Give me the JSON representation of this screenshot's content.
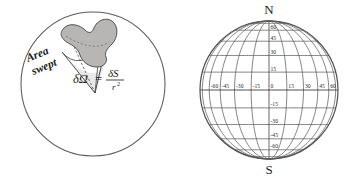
{
  "figure": {
    "width": 357,
    "height": 178,
    "background": "#ffffff",
    "ink_color": "#3a3a3a",
    "text_color": "#1b1b1b"
  },
  "left_panel": {
    "name": "solid-angle-diagram",
    "sphere": {
      "label": "sphere-outline",
      "cx": 93,
      "cy": 84,
      "r": 72,
      "stroke": "#5a5a5a"
    },
    "patch": {
      "label": "Area swept",
      "fill": "#b8b6b4",
      "stroke": "#4a4a4a"
    },
    "annotation": {
      "area_label_line1": "Area",
      "area_label_line2": "swept",
      "rotation_deg": -22
    },
    "formula": {
      "symbol": "δΩ",
      "equals": "=",
      "numerator": "δS",
      "denominator": "r",
      "denominator_exponent": "2",
      "full_text": "δΩ = δS / r²"
    },
    "apex": {
      "x": 95,
      "y": 93
    }
  },
  "right_panel": {
    "name": "globe-graticule-diagram",
    "globe": {
      "cx": 89,
      "cy": 90,
      "rx": 69,
      "ry": 69,
      "stroke": "#4f4f4f"
    },
    "poles": {
      "north_label": "N",
      "south_label": "S"
    },
    "graticule": {
      "spacing_degrees": 15,
      "meridian_longitudes": [
        -75,
        -60,
        -45,
        -30,
        -15,
        0,
        15,
        30,
        45,
        60,
        75
      ],
      "parallel_latitudes": [
        75,
        60,
        45,
        30,
        15,
        0,
        -15,
        -30,
        -45,
        -60,
        -75
      ],
      "grid_color": "#5a5a5a",
      "equator_color": "#4a4a4a"
    },
    "longitude_labels": [
      "-60",
      "-45",
      "-30",
      "-15",
      "0",
      "15",
      "30",
      "45",
      "60"
    ],
    "longitude_label_values": [
      -60,
      -45,
      -30,
      -15,
      0,
      15,
      30,
      45,
      60
    ],
    "latitude_labels_north": [
      "60",
      "45",
      "30",
      "15"
    ],
    "latitude_label_values_north": [
      60,
      45,
      30,
      15
    ],
    "latitude_labels_south": [
      "-15",
      "-30",
      "-45",
      "-60"
    ],
    "latitude_label_values_south": [
      -15,
      -30,
      -45,
      -60
    ]
  }
}
